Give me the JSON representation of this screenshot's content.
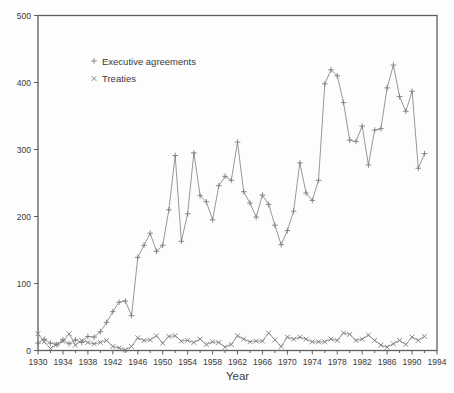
{
  "figure": {
    "background": "#fdfdfd",
    "series_color": "#8c8c8c",
    "marker_color": "#7d7d7d",
    "axis_color": "#5f5f5f",
    "label_color": "#3a3a3a"
  },
  "chart_data": {
    "type": "line",
    "title": "",
    "xlabel": "Year",
    "ylabel": "",
    "xlim": [
      1930,
      1994
    ],
    "ylim": [
      0,
      500
    ],
    "x_major_tick_step": 4,
    "x_minor_tick_step": 2,
    "y_tick_step": 100,
    "y_ticks": [
      0,
      100,
      200,
      300,
      400,
      500
    ],
    "x_tick_labels": [
      "1930",
      "1934",
      "1938",
      "1942",
      "1946",
      "1950",
      "1954",
      "1958",
      "1962",
      "1966",
      "1970",
      "1974",
      "1978",
      "1982",
      "1986",
      "1990",
      "1994"
    ],
    "grid": false,
    "legend_position": "upper-left-inside",
    "x_start": 1930,
    "series": [
      {
        "name": "Executive agreements",
        "marker": "plus",
        "values": [
          11,
          17,
          11,
          9,
          16,
          10,
          16,
          12,
          21,
          20,
          28,
          42,
          58,
          72,
          74,
          52,
          139,
          157,
          175,
          148,
          157,
          210,
          291,
          163,
          204,
          295,
          231,
          222,
          195,
          246,
          260,
          254,
          311,
          237,
          220,
          199,
          232,
          218,
          187,
          158,
          179,
          208,
          280,
          235,
          224,
          254,
          398,
          419,
          410,
          370,
          314,
          312,
          335,
          277,
          329,
          331,
          392,
          426,
          379,
          357,
          387,
          272,
          294
        ]
      },
      {
        "name": "Treaties",
        "marker": "cross",
        "values": [
          25,
          13,
          3,
          9,
          14,
          25,
          8,
          15,
          12,
          10,
          12,
          15,
          6,
          4,
          1,
          6,
          19,
          15,
          16,
          22,
          11,
          21,
          22,
          14,
          15,
          12,
          17,
          9,
          13,
          12,
          5,
          9,
          22,
          17,
          13,
          14,
          14,
          26,
          16,
          6,
          20,
          17,
          20,
          17,
          13,
          13,
          13,
          17,
          15,
          26,
          24,
          15,
          17,
          23,
          15,
          8,
          5,
          10,
          15,
          9,
          20,
          15,
          21
        ]
      }
    ]
  }
}
